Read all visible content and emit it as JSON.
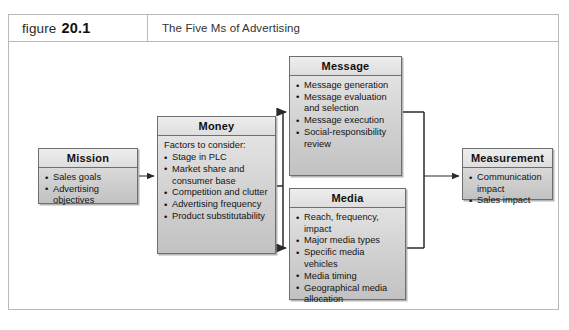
{
  "figure": {
    "label_word": "figure",
    "label_number": "20.1",
    "caption": "The Five Ms of Advertising"
  },
  "theme": {
    "box_fill": "#d2d2d2",
    "box_border": "#6e6e6e",
    "frame_border": "#b9b9b9",
    "connector": "#2a2a2a",
    "text": "#141414"
  },
  "diagram": {
    "type": "flow",
    "boxes": [
      {
        "id": "mission",
        "title": "Mission",
        "lead": "",
        "items": [
          "Sales goals",
          "Advertising objectives"
        ]
      },
      {
        "id": "money",
        "title": "Money",
        "lead": "Factors to consider:",
        "items": [
          "Stage in PLC",
          "Market share and consumer base",
          "Competition and clutter",
          "Advertising frequency",
          "Product substitutability"
        ]
      },
      {
        "id": "message",
        "title": "Message",
        "lead": "",
        "items": [
          "Message generation",
          "Message evaluation and selection",
          "Message execution",
          "Social-responsibility review"
        ]
      },
      {
        "id": "media",
        "title": "Media",
        "lead": "",
        "items": [
          "Reach, frequency, impact",
          "Major media types",
          "Specific media vehicles",
          "Media timing",
          "Geographical media allocation"
        ]
      },
      {
        "id": "measurement",
        "title": "Measurement",
        "lead": "",
        "items": [
          "Communication impact",
          "Sales impact"
        ]
      }
    ],
    "connections": [
      {
        "from": "mission",
        "to": "money"
      },
      {
        "from": "money",
        "to": "message"
      },
      {
        "from": "money",
        "to": "media"
      },
      {
        "from": "message",
        "to": "measurement"
      },
      {
        "from": "media",
        "to": "measurement"
      }
    ]
  }
}
